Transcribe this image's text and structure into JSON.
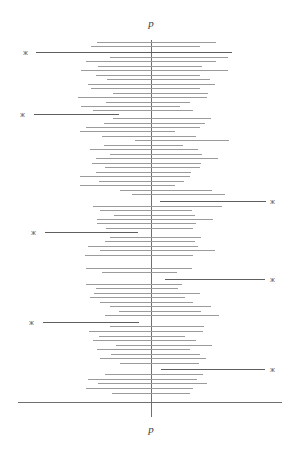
{
  "figure": {
    "type": "forest-plot",
    "width": 299,
    "height": 451,
    "background": "#ffffff",
    "line_color": "#9b9b9b",
    "highlight_color": "#5e5e5e",
    "axis_color": "#707070"
  },
  "axes": {
    "top_label": "p",
    "bottom_label": "p",
    "vertical_reference_x": 151,
    "vertical_reference_top": 40,
    "vertical_reference_bottom": 417,
    "horizontal_axis_y": 402,
    "horizontal_axis_x1": 18,
    "horizontal_axis_x2": 282
  },
  "marker": {
    "glyph": "⁎",
    "color": "#6a6a6a"
  },
  "chart_data": {
    "type": "forest",
    "title": "",
    "xlabel": "p",
    "ylabel": "",
    "grid": false,
    "legend": null,
    "reference_line": "p",
    "n_intervals": 62,
    "n_highlighted": 6,
    "intervals": [
      {
        "y": 42,
        "x1": 97,
        "x2": 216,
        "highlight": false
      },
      {
        "y": 46,
        "x1": 91,
        "x2": 200,
        "highlight": false
      },
      {
        "y": 52,
        "x1": 36,
        "x2": 232,
        "highlight": true,
        "star": "left"
      },
      {
        "y": 57,
        "x1": 110,
        "x2": 228,
        "highlight": false
      },
      {
        "y": 61,
        "x1": 86,
        "x2": 216,
        "highlight": false
      },
      {
        "y": 66,
        "x1": 98,
        "x2": 202,
        "highlight": false
      },
      {
        "y": 70,
        "x1": 81,
        "x2": 228,
        "highlight": false
      },
      {
        "y": 75,
        "x1": 96,
        "x2": 200,
        "highlight": false
      },
      {
        "y": 79,
        "x1": 107,
        "x2": 210,
        "highlight": false
      },
      {
        "y": 84,
        "x1": 88,
        "x2": 215,
        "highlight": false
      },
      {
        "y": 88,
        "x1": 91,
        "x2": 200,
        "highlight": false
      },
      {
        "y": 93,
        "x1": 113,
        "x2": 208,
        "highlight": false
      },
      {
        "y": 97,
        "x1": 78,
        "x2": 207,
        "highlight": false
      },
      {
        "y": 102,
        "x1": 106,
        "x2": 190,
        "highlight": false
      },
      {
        "y": 106,
        "x1": 81,
        "x2": 180,
        "highlight": false
      },
      {
        "y": 110,
        "x1": 93,
        "x2": 193,
        "highlight": false
      },
      {
        "y": 114,
        "x1": 34,
        "x2": 119,
        "highlight": true,
        "star": "left"
      },
      {
        "y": 118,
        "x1": 113,
        "x2": 211,
        "highlight": false
      },
      {
        "y": 123,
        "x1": 104,
        "x2": 205,
        "highlight": false
      },
      {
        "y": 127,
        "x1": 86,
        "x2": 200,
        "highlight": false
      },
      {
        "y": 131,
        "x1": 80,
        "x2": 175,
        "highlight": false
      },
      {
        "y": 136,
        "x1": 102,
        "x2": 196,
        "highlight": false
      },
      {
        "y": 140,
        "x1": 135,
        "x2": 229,
        "highlight": false
      },
      {
        "y": 145,
        "x1": 104,
        "x2": 183,
        "highlight": false
      },
      {
        "y": 149,
        "x1": 90,
        "x2": 198,
        "highlight": false
      },
      {
        "y": 154,
        "x1": 110,
        "x2": 202,
        "highlight": false
      },
      {
        "y": 158,
        "x1": 96,
        "x2": 218,
        "highlight": false
      },
      {
        "y": 163,
        "x1": 92,
        "x2": 201,
        "highlight": false
      },
      {
        "y": 167,
        "x1": 105,
        "x2": 200,
        "highlight": false
      },
      {
        "y": 172,
        "x1": 96,
        "x2": 191,
        "highlight": false
      },
      {
        "y": 176,
        "x1": 80,
        "x2": 190,
        "highlight": false
      },
      {
        "y": 181,
        "x1": 99,
        "x2": 184,
        "highlight": false
      },
      {
        "y": 185,
        "x1": 80,
        "x2": 175,
        "highlight": false
      },
      {
        "y": 190,
        "x1": 120,
        "x2": 212,
        "highlight": false
      },
      {
        "y": 194,
        "x1": 132,
        "x2": 225,
        "highlight": false
      },
      {
        "y": 201,
        "x1": 160,
        "x2": 266,
        "highlight": true,
        "star": "right"
      },
      {
        "y": 206,
        "x1": 93,
        "x2": 222,
        "highlight": false
      },
      {
        "y": 210,
        "x1": 100,
        "x2": 192,
        "highlight": false
      },
      {
        "y": 215,
        "x1": 114,
        "x2": 195,
        "highlight": false
      },
      {
        "y": 219,
        "x1": 97,
        "x2": 213,
        "highlight": false
      },
      {
        "y": 223,
        "x1": 97,
        "x2": 196,
        "highlight": false
      },
      {
        "y": 228,
        "x1": 106,
        "x2": 193,
        "highlight": false
      },
      {
        "y": 232,
        "x1": 45,
        "x2": 138,
        "highlight": true,
        "star": "left"
      },
      {
        "y": 237,
        "x1": 110,
        "x2": 201,
        "highlight": false
      },
      {
        "y": 241,
        "x1": 105,
        "x2": 195,
        "highlight": false
      },
      {
        "y": 246,
        "x1": 88,
        "x2": 198,
        "highlight": false
      },
      {
        "y": 250,
        "x1": 100,
        "x2": 215,
        "highlight": false
      },
      {
        "y": 255,
        "x1": 85,
        "x2": 193,
        "highlight": false
      },
      {
        "y": 268,
        "x1": 86,
        "x2": 192,
        "highlight": false
      },
      {
        "y": 272,
        "x1": 102,
        "x2": 177,
        "highlight": false
      },
      {
        "y": 279,
        "x1": 165,
        "x2": 265,
        "highlight": true,
        "star": "right"
      },
      {
        "y": 284,
        "x1": 86,
        "x2": 182,
        "highlight": false
      },
      {
        "y": 288,
        "x1": 96,
        "x2": 178,
        "highlight": false
      },
      {
        "y": 293,
        "x1": 94,
        "x2": 200,
        "highlight": false
      },
      {
        "y": 297,
        "x1": 90,
        "x2": 185,
        "highlight": false
      },
      {
        "y": 302,
        "x1": 100,
        "x2": 193,
        "highlight": false
      },
      {
        "y": 306,
        "x1": 110,
        "x2": 211,
        "highlight": false
      },
      {
        "y": 311,
        "x1": 119,
        "x2": 201,
        "highlight": false
      },
      {
        "y": 315,
        "x1": 105,
        "x2": 219,
        "highlight": false
      },
      {
        "y": 322,
        "x1": 43,
        "x2": 139,
        "highlight": true,
        "star": "left"
      },
      {
        "y": 326,
        "x1": 110,
        "x2": 204,
        "highlight": false
      },
      {
        "y": 331,
        "x1": 89,
        "x2": 203,
        "highlight": false
      },
      {
        "y": 336,
        "x1": 99,
        "x2": 185,
        "highlight": false
      },
      {
        "y": 340,
        "x1": 93,
        "x2": 196,
        "highlight": false
      },
      {
        "y": 345,
        "x1": 116,
        "x2": 212,
        "highlight": false
      },
      {
        "y": 349,
        "x1": 97,
        "x2": 190,
        "highlight": false
      },
      {
        "y": 354,
        "x1": 111,
        "x2": 200,
        "highlight": false
      },
      {
        "y": 358,
        "x1": 100,
        "x2": 206,
        "highlight": false
      },
      {
        "y": 363,
        "x1": 120,
        "x2": 199,
        "highlight": false
      },
      {
        "y": 369,
        "x1": 161,
        "x2": 265,
        "highlight": true,
        "star": "right"
      },
      {
        "y": 374,
        "x1": 105,
        "x2": 203,
        "highlight": false
      },
      {
        "y": 379,
        "x1": 88,
        "x2": 197,
        "highlight": false
      },
      {
        "y": 383,
        "x1": 98,
        "x2": 207,
        "highlight": false
      },
      {
        "y": 388,
        "x1": 86,
        "x2": 193,
        "highlight": false
      },
      {
        "y": 393,
        "x1": 112,
        "x2": 190,
        "highlight": false
      }
    ],
    "stars": [
      {
        "x": 25,
        "y": 52,
        "side": "left"
      },
      {
        "x": 22,
        "y": 114,
        "side": "left"
      },
      {
        "x": 33,
        "y": 232,
        "side": "left"
      },
      {
        "x": 31,
        "y": 322,
        "side": "left"
      },
      {
        "x": 272,
        "y": 201,
        "side": "right"
      },
      {
        "x": 272,
        "y": 279,
        "side": "right"
      },
      {
        "x": 272,
        "y": 369,
        "side": "right"
      }
    ]
  }
}
